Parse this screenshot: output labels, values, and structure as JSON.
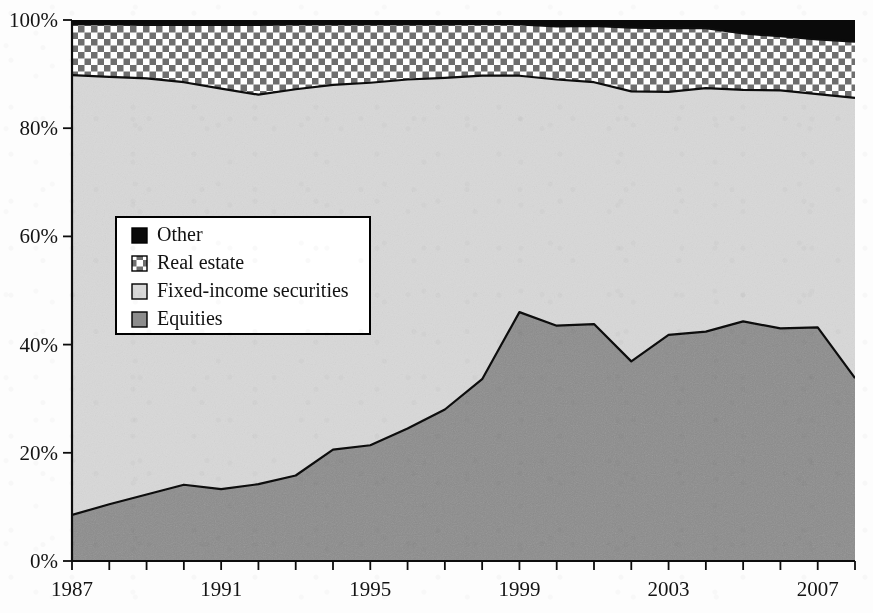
{
  "figure": {
    "name": "asset-allocation-stacked-area-chart",
    "background_color": "#fdfdfd"
  },
  "colors": {
    "other": "#0a0a0a",
    "real_estate_checker_dark": "#6e6e6e",
    "real_estate_checker_light": "#ffffff",
    "fixed_income": "#d8d8d8",
    "equities": "#8c8c8c",
    "outline": "#0d0d0d",
    "axis": "#0d0d0d",
    "text": "#141414"
  },
  "legend": {
    "position": "inner-left",
    "items": [
      {
        "label": "Other",
        "swatch": "solid-black",
        "color": "#0a0a0a"
      },
      {
        "label": "Real estate",
        "swatch": "checkered",
        "color": "#6e6e6e"
      },
      {
        "label": "Fixed-income securities",
        "swatch": "light-gray",
        "color": "#d8d8d8"
      },
      {
        "label": "Equities",
        "swatch": "medium-gray",
        "color": "#8c8c8c"
      }
    ]
  },
  "axes": {
    "y": {
      "ticks": [
        "0%",
        "20%",
        "40%",
        "60%",
        "80%",
        "100%"
      ],
      "values": [
        0,
        20,
        40,
        60,
        80,
        100
      ],
      "min": 0,
      "max": 100,
      "label": ""
    },
    "x": {
      "labeled_ticks": [
        "1987",
        "1991",
        "1995",
        "1999",
        "2003",
        "2007"
      ],
      "min": 1987,
      "max": 2008,
      "tick_interval_years": 1,
      "label_interval_years": 4,
      "label": ""
    }
  },
  "chart_data": {
    "type": "area",
    "stacked": true,
    "normalized_percent": true,
    "title": "",
    "xlabel": "",
    "ylabel": "",
    "ylim": [
      0,
      100
    ],
    "xlim": [
      1987,
      2008
    ],
    "grid": false,
    "legend_position": "inner-left",
    "x": [
      1987,
      1988,
      1989,
      1990,
      1991,
      1992,
      1993,
      1994,
      1995,
      1996,
      1997,
      1998,
      1999,
      2000,
      2001,
      2002,
      2003,
      2004,
      2005,
      2006,
      2007,
      2008
    ],
    "categories": [
      "1987",
      "1988",
      "1989",
      "1990",
      "1991",
      "1992",
      "1993",
      "1994",
      "1995",
      "1996",
      "1997",
      "1998",
      "1999",
      "2000",
      "2001",
      "2002",
      "2003",
      "2004",
      "2005",
      "2006",
      "2007",
      "2008"
    ],
    "series": [
      {
        "name": "Equities",
        "color": "#8c8c8c",
        "values": [
          8.5,
          10.5,
          12.3,
          14.1,
          13.3,
          14.2,
          15.8,
          20.6,
          21.4,
          24.5,
          28.0,
          33.6,
          46.0,
          43.5,
          43.8,
          36.9,
          41.8,
          42.4,
          44.3,
          43.0,
          43.2,
          33.8
        ]
      },
      {
        "name": "Fixed-income securities",
        "color": "#d8d8d8",
        "values": [
          81.3,
          79.0,
          76.9,
          74.4,
          74.0,
          72.0,
          71.4,
          67.4,
          67.0,
          64.5,
          61.3,
          56.1,
          43.7,
          45.5,
          44.7,
          49.9,
          44.9,
          45.0,
          42.8,
          44.0,
          43.1,
          51.8
        ]
      },
      {
        "name": "Real estate",
        "color": "#6e6e6e",
        "pattern": "checkered",
        "values": [
          9.4,
          9.7,
          9.9,
          10.6,
          11.8,
          12.9,
          12.0,
          11.2,
          10.8,
          10.2,
          9.9,
          9.6,
          9.5,
          9.8,
          10.4,
          11.8,
          11.8,
          11.1,
          10.4,
          10.0,
          10.1,
          10.4
        ]
      },
      {
        "name": "Other",
        "color": "#0a0a0a",
        "values": [
          0.8,
          0.8,
          0.9,
          0.9,
          0.9,
          0.9,
          0.8,
          0.8,
          0.8,
          0.8,
          0.8,
          0.7,
          0.8,
          1.2,
          1.1,
          1.4,
          1.5,
          1.5,
          2.5,
          3.0,
          3.6,
          4.0
        ]
      }
    ],
    "cumulative_boundaries": {
      "note": "upper edge of each stacked band, percent",
      "equities_top": [
        8.5,
        10.5,
        12.3,
        14.1,
        13.3,
        14.2,
        15.8,
        20.6,
        21.4,
        24.5,
        28.0,
        33.6,
        46.0,
        43.5,
        43.8,
        36.9,
        41.8,
        42.4,
        44.3,
        43.0,
        43.2,
        33.8
      ],
      "fixed_income_top": [
        89.8,
        89.5,
        89.2,
        88.5,
        87.3,
        86.2,
        87.2,
        88.0,
        88.4,
        89.0,
        89.3,
        89.7,
        89.7,
        89.0,
        88.5,
        86.8,
        86.7,
        87.4,
        87.1,
        87.0,
        86.3,
        85.6
      ],
      "real_estate_top": [
        99.2,
        99.2,
        99.1,
        99.1,
        99.1,
        99.1,
        99.2,
        99.2,
        99.2,
        99.2,
        99.2,
        99.3,
        99.2,
        98.8,
        98.9,
        98.6,
        98.5,
        98.5,
        97.5,
        97.0,
        96.4,
        96.0
      ],
      "other_top": [
        100,
        100,
        100,
        100,
        100,
        100,
        100,
        100,
        100,
        100,
        100,
        100,
        100,
        100,
        100,
        100,
        100,
        100,
        100,
        100,
        100,
        100
      ]
    }
  }
}
